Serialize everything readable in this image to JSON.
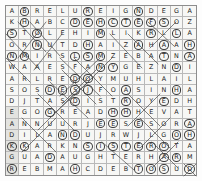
{
  "puzzle": {
    "type": "word-search",
    "rows": 15,
    "cols": 15,
    "grid": [
      [
        "A",
        "B",
        "R",
        "E",
        "L",
        "U",
        "R",
        "E",
        "I",
        "G",
        "N",
        "D",
        "E",
        "G",
        "A"
      ],
      [
        "K",
        "H",
        "A",
        "B",
        "C",
        "D",
        "E",
        "H",
        "C",
        "T",
        "E",
        "F",
        "S",
        "O",
        "Z"
      ],
      [
        "S",
        "T",
        "O",
        "L",
        "E",
        "H",
        "I",
        "M",
        "L",
        "I",
        "K",
        "R",
        "L",
        "L",
        "A"
      ],
      [
        "O",
        "R",
        "N",
        "U",
        "T",
        "D",
        "H",
        "A",
        "I",
        "Z",
        "A",
        "H",
        "A",
        "A",
        "H"
      ],
      [
        "N",
        "M",
        "I",
        "R",
        "S",
        "L",
        "S",
        "M",
        "Z",
        "E",
        "B",
        "A",
        "T",
        "N",
        "A"
      ],
      [
        "W",
        "A",
        "A",
        "E",
        "S",
        "F",
        "A",
        "N",
        "Y",
        "G",
        "E",
        "Z",
        "N",
        "D",
        "I"
      ],
      [
        "A",
        "R",
        "L",
        "R",
        "E",
        "D",
        "O",
        "Y",
        "M",
        "U",
        "H",
        "L",
        "A",
        "I",
        "L"
      ],
      [
        "S",
        "O",
        "S",
        "D",
        "E",
        "S",
        "J",
        "F",
        "O",
        "A",
        "S",
        "I",
        "N",
        "H",
        "A"
      ],
      [
        "D",
        "J",
        "T",
        "A",
        "S",
        "D",
        "I",
        "S",
        "T",
        "R",
        "O",
        "Y",
        "E",
        "D",
        "H"
      ],
      [
        "E",
        "G",
        "O",
        "G",
        "R",
        "E",
        "A",
        "D",
        "H",
        "H",
        "H",
        "E",
        "V",
        "A",
        "T"
      ],
      [
        "A",
        "N",
        "N",
        "U",
        "U",
        "R",
        "J",
        "E",
        "E",
        "S",
        "E",
        "S",
        "O",
        "R",
        "A"
      ],
      [
        "D",
        "I",
        "L",
        "A",
        "N",
        "D",
        "U",
        "J",
        "R",
        "W",
        "J",
        "L",
        "G",
        "O",
        "H"
      ],
      [
        "K",
        "K",
        "A",
        "R",
        "K",
        "N",
        "S",
        "I",
        "S",
        "T",
        "E",
        "R",
        "O",
        "T",
        "A"
      ],
      [
        "G",
        "U",
        "A",
        "D",
        "A",
        "U",
        "G",
        "H",
        "T",
        "E",
        "R",
        "H",
        "A",
        "R",
        "M"
      ],
      [
        "R",
        "E",
        "B",
        "M",
        "A",
        "H",
        "C",
        "D",
        "E",
        "B",
        "T",
        "O",
        "S",
        "U",
        "D"
      ]
    ],
    "marked_cells": [
      [
        0,
        1
      ],
      [
        0,
        6
      ],
      [
        0,
        10
      ],
      [
        1,
        1
      ],
      [
        1,
        5
      ],
      [
        1,
        6
      ],
      [
        1,
        7
      ],
      [
        1,
        8
      ],
      [
        1,
        9
      ],
      [
        1,
        10
      ],
      [
        1,
        11
      ],
      [
        1,
        12
      ],
      [
        2,
        0
      ],
      [
        2,
        2
      ],
      [
        2,
        7
      ],
      [
        2,
        11
      ],
      [
        2,
        13
      ],
      [
        3,
        2
      ],
      [
        3,
        6
      ],
      [
        3,
        10
      ],
      [
        3,
        12
      ],
      [
        3,
        14
      ],
      [
        4,
        0
      ],
      [
        4,
        1
      ],
      [
        4,
        5
      ],
      [
        4,
        6
      ],
      [
        4,
        7
      ],
      [
        4,
        12
      ],
      [
        4,
        14
      ],
      [
        5,
        7
      ],
      [
        5,
        8
      ],
      [
        5,
        13
      ],
      [
        6,
        5
      ],
      [
        6,
        6
      ],
      [
        7,
        3
      ],
      [
        7,
        4
      ],
      [
        7,
        5
      ],
      [
        7,
        6
      ],
      [
        7,
        9
      ],
      [
        7,
        13
      ],
      [
        8,
        5
      ],
      [
        8,
        9
      ],
      [
        8,
        12
      ],
      [
        9,
        3
      ],
      [
        9,
        8
      ],
      [
        9,
        9
      ],
      [
        10,
        7
      ],
      [
        10,
        8
      ],
      [
        10,
        10
      ],
      [
        10,
        14
      ],
      [
        11,
        4
      ],
      [
        11,
        5
      ],
      [
        11,
        13
      ],
      [
        11,
        14
      ],
      [
        12,
        0
      ],
      [
        12,
        1
      ],
      [
        12,
        6
      ],
      [
        12,
        7
      ],
      [
        12,
        8
      ],
      [
        12,
        9
      ],
      [
        12,
        10
      ],
      [
        12,
        11
      ],
      [
        12,
        12
      ],
      [
        13,
        3
      ],
      [
        13,
        12
      ],
      [
        13,
        13
      ],
      [
        14,
        0
      ],
      [
        14,
        5
      ],
      [
        14,
        10
      ],
      [
        14,
        11
      ],
      [
        14,
        12
      ],
      [
        14,
        14
      ]
    ],
    "shaded_cells": [
      [
        9,
        0
      ],
      [
        10,
        0
      ],
      [
        11,
        0
      ],
      [
        12,
        0
      ],
      [
        13,
        0
      ],
      [
        14,
        0
      ]
    ],
    "found_words": [
      "BRELURE",
      "REIGN",
      "DEHCTEF",
      "STOLE",
      "SISTER",
      "DAUGHTER",
      "DISTROYED",
      "HARM",
      "REBMAHC",
      "LAND",
      "HOUSE"
    ]
  }
}
